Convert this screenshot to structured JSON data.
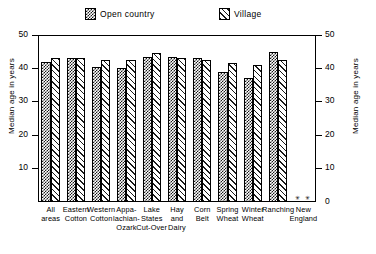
{
  "chart_data": {
    "type": "bar",
    "title": "",
    "xlabel": "",
    "ylabel": "Median age in years",
    "ylabel_right": "Median age in years",
    "ylim": [
      0,
      50
    ],
    "yticks": [
      10,
      20,
      30,
      40,
      50
    ],
    "grid": false,
    "legend_position": "top",
    "categories": [
      "All areas",
      "Eastern Cotton",
      "Western Cotton",
      "Appa-lachian-Ozark",
      "Lake States Cut-Over",
      "Hay and Dairy",
      "Corn Belt",
      "Spring Wheat",
      "Winter Wheat",
      "Ranching",
      "New England"
    ],
    "category_lines": [
      [
        "All",
        "areas"
      ],
      [
        "Eastern",
        "Cotton"
      ],
      [
        "Western",
        "Cotton"
      ],
      [
        "Appa-",
        "lachian-",
        "Ozark"
      ],
      [
        "Lake",
        "States",
        "Cut-Over"
      ],
      [
        "Hay",
        "and",
        "Dairy"
      ],
      [
        "Corn",
        "Belt"
      ],
      [
        "Spring",
        "Wheat"
      ],
      [
        "Winter",
        "Wheat"
      ],
      [
        "Ranching",
        "",
        ""
      ],
      [
        "New",
        "England"
      ]
    ],
    "series": [
      {
        "name": "Open country",
        "pattern": "checker",
        "values": [
          42.0,
          43.0,
          40.5,
          40.0,
          43.5,
          43.5,
          43.0,
          39.0,
          37.0,
          45.0,
          null
        ]
      },
      {
        "name": "Village",
        "pattern": "diagonal-hatch",
        "values": [
          43.0,
          43.0,
          42.5,
          42.5,
          44.5,
          43.0,
          42.5,
          41.5,
          41.0,
          42.5,
          null
        ]
      }
    ],
    "no_data_marker": "✳",
    "no_data_categories": [
      "New England"
    ]
  },
  "legend": {
    "entries": [
      {
        "label": "Open country",
        "swatch": "checker-swatch"
      },
      {
        "label": "Village",
        "swatch": "hatch-swatch"
      }
    ]
  },
  "axes": {
    "left": {
      "title": "Median age in years",
      "ticks": [
        "50",
        "40",
        "30",
        "20",
        "10"
      ]
    },
    "right": {
      "title": "Median age in years",
      "ticks": [
        "50",
        "40",
        "30",
        "20",
        "10",
        "0"
      ]
    }
  },
  "colors": {
    "ink": "#000000",
    "paper": "#ffffff"
  }
}
